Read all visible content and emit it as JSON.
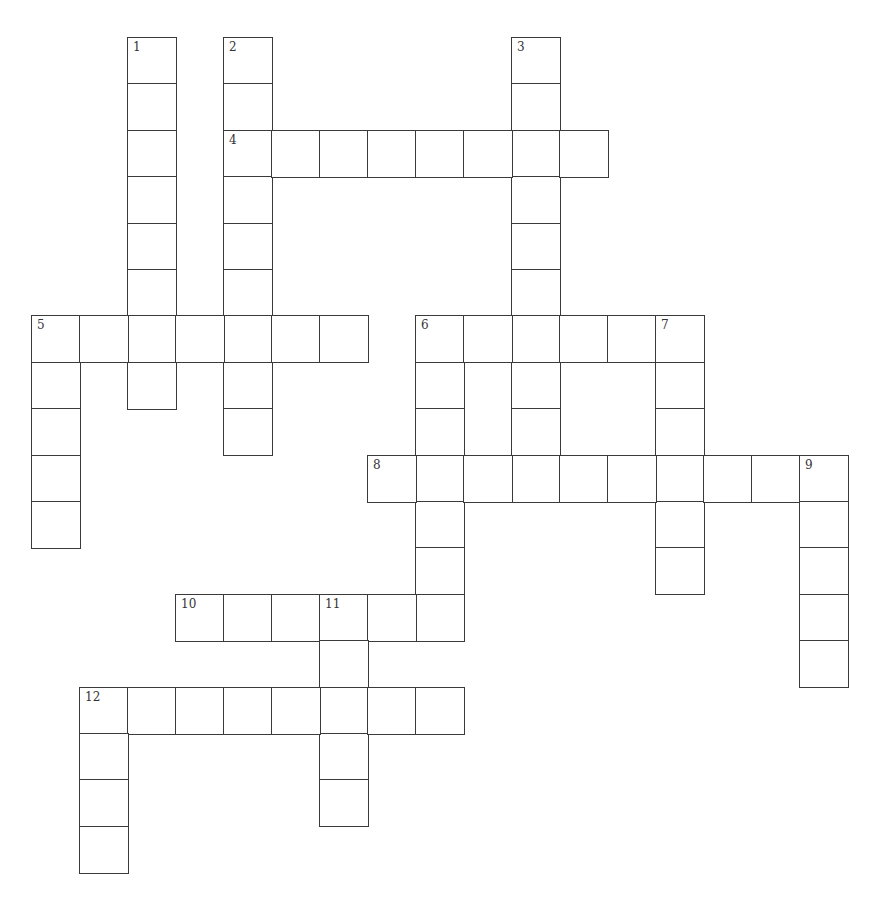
{
  "puzzle": {
    "grid": {
      "origin_x": 31,
      "origin_y": 37,
      "cell_w": 48,
      "cell_h": 46.4,
      "border_color": "#3a3a3a"
    },
    "entries": [
      {
        "number": "1",
        "direction": "down",
        "row": 0,
        "col": 2,
        "length": 8
      },
      {
        "number": "2",
        "direction": "down",
        "row": 0,
        "col": 4,
        "length": 9
      },
      {
        "number": "3",
        "direction": "down",
        "row": 0,
        "col": 10,
        "length": 10
      },
      {
        "number": "4",
        "direction": "across",
        "row": 2,
        "col": 4,
        "length": 8
      },
      {
        "number": "5",
        "direction": "across",
        "row": 6,
        "col": 0,
        "length": 7
      },
      {
        "number": "5",
        "direction": "down",
        "row": 6,
        "col": 0,
        "length": 5
      },
      {
        "number": "6",
        "direction": "across",
        "row": 6,
        "col": 8,
        "length": 6
      },
      {
        "number": "6",
        "direction": "down",
        "row": 6,
        "col": 8,
        "length": 7
      },
      {
        "number": "7",
        "direction": "down",
        "row": 6,
        "col": 13,
        "length": 6
      },
      {
        "number": "8",
        "direction": "across",
        "row": 9,
        "col": 7,
        "length": 10
      },
      {
        "number": "9",
        "direction": "down",
        "row": 9,
        "col": 16,
        "length": 5
      },
      {
        "number": "10",
        "direction": "across",
        "row": 12,
        "col": 3,
        "length": 6
      },
      {
        "number": "11",
        "direction": "down",
        "row": 12,
        "col": 6,
        "length": 5
      },
      {
        "number": "12",
        "direction": "across",
        "row": 14,
        "col": 1,
        "length": 8
      },
      {
        "number": "12",
        "direction": "down",
        "row": 14,
        "col": 1,
        "length": 4
      }
    ]
  }
}
